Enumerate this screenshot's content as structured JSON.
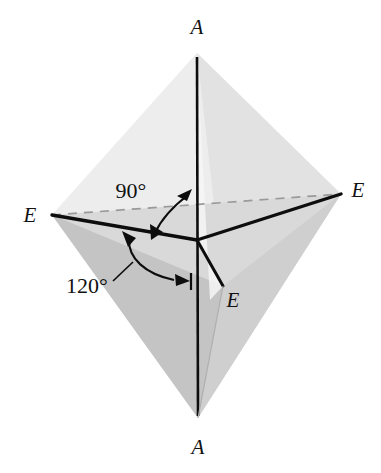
{
  "figure": {
    "name": "trigonal-bipyramid-geometry",
    "background_color": "#ffffff"
  },
  "labels": {
    "axial_top": "A",
    "axial_bottom": "A",
    "equatorial_left": "E",
    "equatorial_right": "E",
    "equatorial_front": "E"
  },
  "angles": {
    "axial_equatorial": "90°",
    "equatorial_equatorial": "120°"
  },
  "colors": {
    "line": "#0d0d0d",
    "hidden_edge": "#9a9a9a",
    "face_lightest": "#f2f2f2",
    "face_light": "#e6e6e6",
    "face_mid": "#d6d6d6",
    "face_dark": "#c2c2c2",
    "face_darker": "#b3b3b3",
    "text": "#111111"
  },
  "geometry": {
    "apex_top": [
      197,
      53
    ],
    "apex_bottom": [
      198,
      418
    ],
    "center": [
      197,
      240
    ],
    "vertex_left": [
      52,
      215
    ],
    "vertex_right": [
      341,
      194
    ],
    "vertex_front": [
      223,
      286
    ]
  }
}
